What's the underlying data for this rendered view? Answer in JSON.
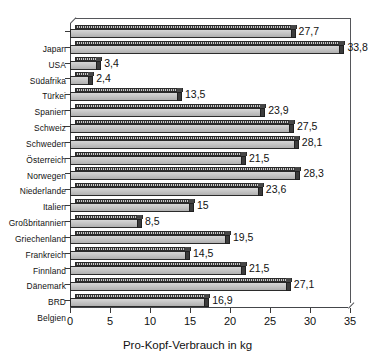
{
  "chart_data": {
    "type": "bar",
    "orientation": "horizontal",
    "title": "",
    "xlabel": "Pro-Kopf-Verbrauch in kg",
    "ylabel": "",
    "xlim": [
      0,
      35
    ],
    "xticks": [
      0,
      5,
      10,
      15,
      20,
      25,
      30,
      35
    ],
    "xtick_labels": [
      "0",
      "5",
      "10",
      "15",
      "20",
      "25",
      "30",
      "35"
    ],
    "grid": false,
    "legend": null,
    "decimal_separator": ",",
    "categories": [
      "Japan",
      "USA",
      "Südafrika",
      "Türkei",
      "Spanien",
      "Schweiz",
      "Schweden",
      "Österreich",
      "Norwegen",
      "Niederlande",
      "Italien",
      "Großbritannien",
      "Griechenland",
      "Frankreich",
      "Finnland",
      "Dänemark",
      "BRD",
      "Belgien"
    ],
    "values": [
      27.7,
      33.8,
      3.4,
      2.4,
      13.5,
      23.9,
      27.5,
      28.1,
      21.5,
      28.3,
      23.6,
      15,
      8.5,
      19.5,
      14.5,
      21.5,
      27.1,
      16.9
    ],
    "value_labels": [
      "27,7",
      "33,8",
      "3,4",
      "2,4",
      "13,5",
      "23,9",
      "27,5",
      "28,1",
      "21,5",
      "28,3",
      "23,6",
      "15",
      "8,5",
      "19,5",
      "14,5",
      "21,5",
      "27,1",
      "16,9"
    ]
  },
  "colors": {
    "bar_front": "#c2c2c2",
    "bar_top": "#8d8d8d",
    "bar_cap": "#3c3c3c",
    "outline": "#2b2b2b",
    "axis": "#3a3a3a",
    "text": "#111111",
    "background": "#ffffff"
  }
}
